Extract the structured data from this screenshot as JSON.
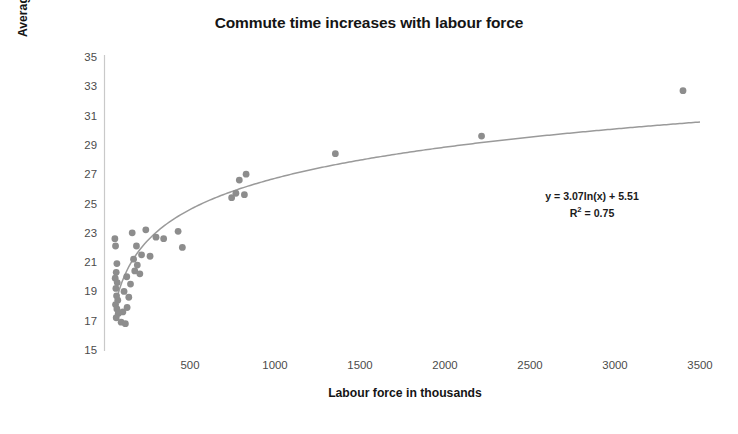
{
  "chart_data": {
    "type": "scatter",
    "title": "Commute time increases with labour force",
    "xlabel": "Labour force in thousands",
    "ylabel": "Average one-way commute time (minutes)",
    "xlim": [
      0,
      3600
    ],
    "ylim": [
      15,
      35
    ],
    "xticks": [
      500,
      1000,
      1500,
      2000,
      2500,
      3000,
      3500
    ],
    "yticks": [
      15,
      17,
      19,
      21,
      23,
      25,
      27,
      29,
      31,
      33,
      35
    ],
    "grid": false,
    "legend": null,
    "marker_color": "#8d8d8d",
    "trendline_color": "#9a9a9a",
    "annotation_equation": "y = 3.07ln(x) + 5.51",
    "annotation_r2_label": "R",
    "annotation_r2_exp": "2",
    "annotation_r2_value": " = 0.75",
    "trendline": {
      "type": "logarithmic",
      "slope": 3.07,
      "intercept": 5.51,
      "r_squared": 0.75,
      "x_start": 60,
      "x_end": 3500
    },
    "points": [
      {
        "x": 58,
        "y": 22.6
      },
      {
        "x": 62,
        "y": 22.1
      },
      {
        "x": 70,
        "y": 20.9
      },
      {
        "x": 66,
        "y": 20.3
      },
      {
        "x": 60,
        "y": 19.9
      },
      {
        "x": 72,
        "y": 19.6
      },
      {
        "x": 64,
        "y": 19.2
      },
      {
        "x": 68,
        "y": 18.7
      },
      {
        "x": 75,
        "y": 18.4
      },
      {
        "x": 62,
        "y": 18.1
      },
      {
        "x": 70,
        "y": 17.8
      },
      {
        "x": 78,
        "y": 17.5
      },
      {
        "x": 66,
        "y": 17.2
      },
      {
        "x": 95,
        "y": 16.9
      },
      {
        "x": 120,
        "y": 16.8
      },
      {
        "x": 105,
        "y": 17.6
      },
      {
        "x": 130,
        "y": 17.9
      },
      {
        "x": 112,
        "y": 19.0
      },
      {
        "x": 140,
        "y": 18.6
      },
      {
        "x": 150,
        "y": 19.5
      },
      {
        "x": 128,
        "y": 20.0
      },
      {
        "x": 175,
        "y": 20.4
      },
      {
        "x": 190,
        "y": 20.8
      },
      {
        "x": 205,
        "y": 20.2
      },
      {
        "x": 168,
        "y": 21.2
      },
      {
        "x": 215,
        "y": 21.5
      },
      {
        "x": 185,
        "y": 22.1
      },
      {
        "x": 160,
        "y": 23.0
      },
      {
        "x": 240,
        "y": 23.2
      },
      {
        "x": 265,
        "y": 21.4
      },
      {
        "x": 300,
        "y": 22.7
      },
      {
        "x": 345,
        "y": 22.6
      },
      {
        "x": 430,
        "y": 23.1
      },
      {
        "x": 455,
        "y": 22.0
      },
      {
        "x": 745,
        "y": 25.4
      },
      {
        "x": 770,
        "y": 25.7
      },
      {
        "x": 790,
        "y": 26.6
      },
      {
        "x": 820,
        "y": 25.6
      },
      {
        "x": 830,
        "y": 27.0
      },
      {
        "x": 1355,
        "y": 28.4
      },
      {
        "x": 2215,
        "y": 29.6
      },
      {
        "x": 3400,
        "y": 32.7
      }
    ]
  }
}
